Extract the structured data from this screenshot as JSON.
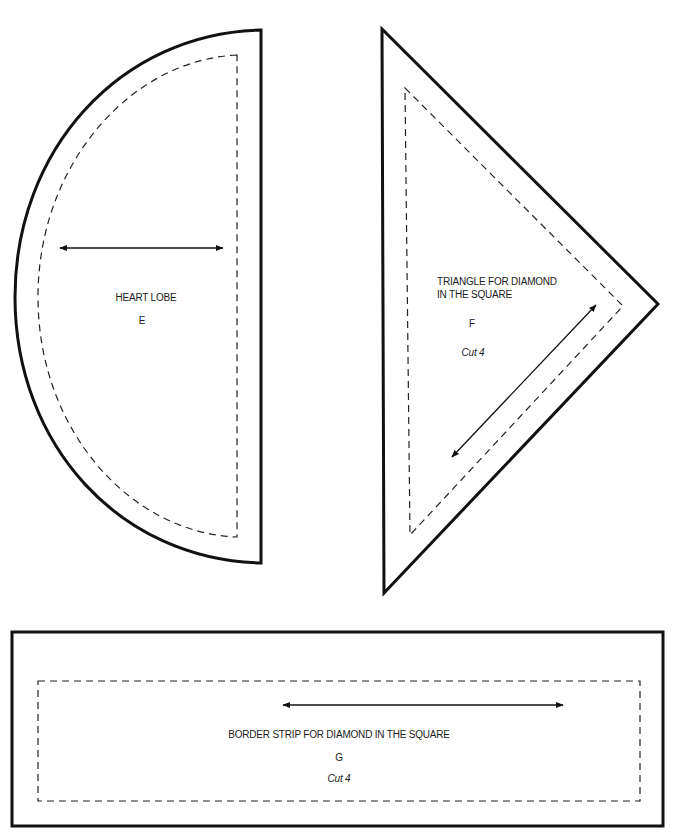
{
  "pieces": [
    {
      "id": "E",
      "name": "HEART LOBE",
      "letter": "E",
      "cut": "",
      "shape": "half-circle",
      "grain_arrow": "horizontal"
    },
    {
      "id": "F",
      "name_line1": "TRIANGLE FOR DIAMOND",
      "name_line2": "IN THE SQUARE",
      "letter": "F",
      "cut": "Cut 4",
      "shape": "triangle",
      "grain_arrow": "diagonal"
    },
    {
      "id": "G",
      "name": "BORDER STRIP FOR DIAMOND IN THE SQUARE",
      "letter": "G",
      "cut": "Cut 4",
      "shape": "rectangle",
      "grain_arrow": "horizontal"
    }
  ],
  "colors": {
    "line": "#111111",
    "background": "#ffffff"
  }
}
